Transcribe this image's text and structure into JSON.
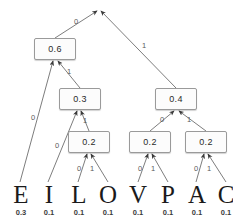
{
  "figure": {
    "type": "huffman-tree",
    "title_fragment": "",
    "node_fill": "#fcfcfc",
    "node_border": "#9a9a9a",
    "edge_color": "#6e6e6e",
    "leaf_color": "#1a1a1a"
  },
  "nodes": [
    {
      "id": "root",
      "label": "",
      "x": 98,
      "y": 8,
      "w": 0,
      "h": 0,
      "visible": false
    },
    {
      "id": "n06",
      "label": "0.6",
      "x": 34,
      "y": 38,
      "w": 42,
      "h": 22,
      "visible": true
    },
    {
      "id": "n04",
      "label": "0.4",
      "x": 155,
      "y": 88,
      "w": 42,
      "h": 22,
      "visible": true
    },
    {
      "id": "n03",
      "label": "0.3",
      "x": 59,
      "y": 88,
      "w": 42,
      "h": 22,
      "visible": true
    },
    {
      "id": "n02a",
      "label": "0.2",
      "x": 68,
      "y": 131,
      "w": 42,
      "h": 22,
      "visible": true
    },
    {
      "id": "n02b",
      "label": "0.2",
      "x": 129,
      "y": 131,
      "w": 42,
      "h": 22,
      "visible": true
    },
    {
      "id": "n02c",
      "label": "0.2",
      "x": 185,
      "y": 131,
      "w": 42,
      "h": 22,
      "visible": true
    }
  ],
  "edges": [
    {
      "from": "n06",
      "to": "root",
      "bit": "0",
      "x1": 55,
      "y1": 38,
      "x2": 97,
      "y2": 11,
      "lx": 74,
      "ly": 18
    },
    {
      "from": "n04",
      "to": "root",
      "bit": "1",
      "x1": 176,
      "y1": 88,
      "x2": 101,
      "y2": 11,
      "lx": 142,
      "ly": 42
    },
    {
      "from": "n03",
      "to": "n06",
      "bit": "1",
      "x1": 80,
      "y1": 88,
      "x2": 58,
      "y2": 61,
      "lx": 67,
      "ly": 68
    },
    {
      "from": "leafE",
      "to": "n06",
      "bit": "0",
      "x1": 20,
      "y1": 182,
      "x2": 53,
      "y2": 61,
      "lx": 31,
      "ly": 114
    },
    {
      "from": "leafI",
      "to": "n03",
      "bit": "0",
      "x1": 48,
      "y1": 182,
      "x2": 77,
      "y2": 111,
      "lx": 55,
      "ly": 142
    },
    {
      "from": "n02a",
      "to": "n03",
      "bit": "1",
      "x1": 89,
      "y1": 131,
      "x2": 81,
      "y2": 111,
      "lx": 83,
      "ly": 117
    },
    {
      "from": "n02b",
      "to": "n04",
      "bit": "0",
      "x1": 150,
      "y1": 131,
      "x2": 174,
      "y2": 111,
      "lx": 160,
      "ly": 116
    },
    {
      "from": "n02c",
      "to": "n04",
      "bit": "1",
      "x1": 206,
      "y1": 131,
      "x2": 179,
      "y2": 111,
      "lx": 187,
      "ly": 116
    },
    {
      "from": "leafL",
      "to": "n02a",
      "bit": "0",
      "x1": 78,
      "y1": 182,
      "x2": 87,
      "y2": 154,
      "lx": 77,
      "ly": 165
    },
    {
      "from": "leafO",
      "to": "n02a",
      "bit": "1",
      "x1": 108,
      "y1": 182,
      "x2": 91,
      "y2": 154,
      "lx": 90,
      "ly": 165
    },
    {
      "from": "leafV",
      "to": "n02b",
      "bit": "0",
      "x1": 138,
      "y1": 182,
      "x2": 148,
      "y2": 154,
      "lx": 138,
      "ly": 165
    },
    {
      "from": "leafP",
      "to": "n02b",
      "bit": "1",
      "x1": 168,
      "y1": 182,
      "x2": 152,
      "y2": 154,
      "lx": 151,
      "ly": 165
    },
    {
      "from": "leafA",
      "to": "n02c",
      "bit": "0",
      "x1": 196,
      "y1": 182,
      "x2": 204,
      "y2": 154,
      "lx": 194,
      "ly": 165
    },
    {
      "from": "leafC",
      "to": "n02c",
      "bit": "1",
      "x1": 226,
      "y1": 182,
      "x2": 208,
      "y2": 154,
      "lx": 207,
      "ly": 165
    }
  ],
  "leaves": [
    {
      "id": "leafE",
      "symbol": "E",
      "weight": "0.3",
      "x": 8,
      "y": 182
    },
    {
      "id": "leafI",
      "symbol": "I",
      "weight": "0.1",
      "x": 36,
      "y": 182
    },
    {
      "id": "leafL",
      "symbol": "L",
      "weight": "0.1",
      "x": 66,
      "y": 182
    },
    {
      "id": "leafO",
      "symbol": "O",
      "weight": "0.1",
      "x": 95,
      "y": 182
    },
    {
      "id": "leafV",
      "symbol": "V",
      "weight": "0.1",
      "x": 125,
      "y": 182
    },
    {
      "id": "leafP",
      "symbol": "P",
      "weight": "0.1",
      "x": 155,
      "y": 182
    },
    {
      "id": "leafA",
      "symbol": "A",
      "weight": "0.1",
      "x": 184,
      "y": 182
    },
    {
      "id": "leafC",
      "symbol": "C",
      "weight": "0.1",
      "x": 213,
      "y": 182
    }
  ],
  "weights_row": [
    "0.3",
    "0.1",
    "0.1",
    "0.1",
    "0.1",
    "0.1",
    "0.1",
    "0.1"
  ],
  "symbols_row": [
    "E",
    "I",
    "L",
    "O",
    "V",
    "P",
    "A",
    "C"
  ]
}
